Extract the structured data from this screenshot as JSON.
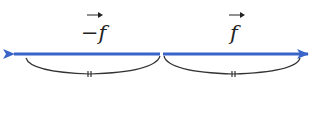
{
  "diagram": {
    "left_vector": {
      "label": "−f",
      "direction": "left",
      "color": "#3a64c8"
    },
    "right_vector": {
      "label": "f",
      "direction": "right",
      "color": "#3a64c8"
    },
    "equal_length_marker": "="
  }
}
